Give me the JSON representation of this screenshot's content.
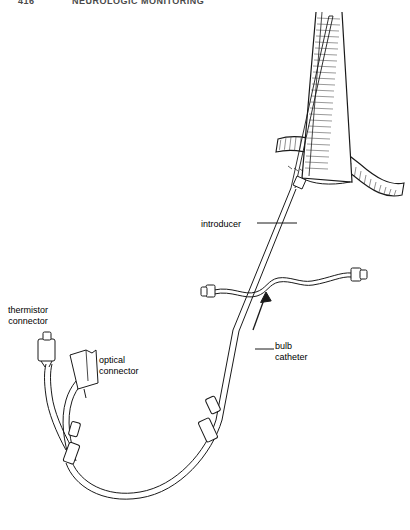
{
  "page": {
    "header_number": "416",
    "header_title": "NEUROLOGIC MONITORING"
  },
  "figure": {
    "labels": [
      {
        "id": "thermistor-connector",
        "text_line1": "thermistor",
        "text_line2": "connector",
        "x": 8,
        "y": 305
      },
      {
        "id": "optical-connector",
        "text_line1": "optical",
        "text_line2": "connector",
        "x": 99,
        "y": 355
      },
      {
        "id": "introducer",
        "text_line1": "introducer",
        "text_line2": "",
        "x": 201,
        "y": 219
      },
      {
        "id": "bulb-catheter",
        "text_line1": "bulb",
        "text_line2": "catheter",
        "x": 275,
        "y": 341
      }
    ],
    "colors": {
      "ink": "#1a1a1a",
      "hatch": "#333333",
      "background": "#ffffff",
      "header_text": "#4a4a4a"
    },
    "parts": {
      "vein": "internal jugular vein",
      "branch_vessel": "carotid / facial vein branch",
      "catheter_shaft": "jugular bulb catheter",
      "introducer_sheath": "percutaneous introducer",
      "side_port_left": "luer hub",
      "side_port_right": "luer hub",
      "arrow": "insertion direction arrow",
      "junction_sleeves": "cable junction sleeves"
    }
  }
}
